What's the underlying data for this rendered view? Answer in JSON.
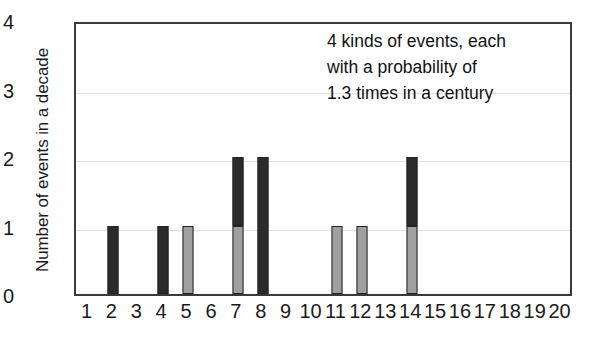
{
  "chart_data": {
    "type": "bar",
    "title": "",
    "xlabel": "",
    "ylabel": "Number of events in a decade",
    "xlim": [
      0.5,
      20.5
    ],
    "ylim": [
      0,
      4
    ],
    "grid": true,
    "stacked": true,
    "legend_position": "none",
    "categories": [
      1,
      2,
      3,
      4,
      5,
      6,
      7,
      8,
      9,
      10,
      11,
      12,
      13,
      14,
      15,
      16,
      17,
      18,
      19,
      20
    ],
    "x_tick_labels": [
      "1",
      "2",
      "3",
      "4",
      "5",
      "6",
      "7",
      "8",
      "9",
      "10",
      "11",
      "12",
      "13",
      "14",
      "15",
      "16",
      "17",
      "18",
      "19",
      "20"
    ],
    "y_tick_labels": [
      "0",
      "1",
      "2",
      "3",
      "4"
    ],
    "y_ticks": [
      0,
      1,
      2,
      3,
      4
    ],
    "gridline_values": [
      1,
      2,
      3
    ],
    "series": [
      {
        "name": "light-gray-events",
        "color": "#a0a0a0",
        "values": [
          0,
          0,
          0,
          0,
          1,
          0,
          1,
          0,
          0,
          0,
          1,
          1,
          0,
          1,
          0,
          0,
          0,
          0,
          0,
          0
        ]
      },
      {
        "name": "dark-events",
        "color": "#2b2b2b",
        "values": [
          0,
          1,
          0,
          1,
          0,
          0,
          1,
          2,
          0,
          0,
          0,
          0,
          0,
          1,
          0,
          0,
          0,
          0,
          0,
          0
        ]
      }
    ],
    "totals": [
      0,
      1,
      0,
      1,
      1,
      0,
      2,
      2,
      0,
      0,
      1,
      1,
      0,
      2,
      0,
      0,
      0,
      0,
      0,
      0
    ],
    "annotation_lines": [
      "4 kinds of events, each",
      "with a probability of",
      "1.3 times in a century"
    ]
  },
  "colors": {
    "dark_bar": "#2b2b2b",
    "light_bar": "#a0a0a0",
    "axis": "#3a3a3a",
    "gridline": "#e2e2e2",
    "text": "#1a1a1a",
    "background": "#ffffff"
  }
}
